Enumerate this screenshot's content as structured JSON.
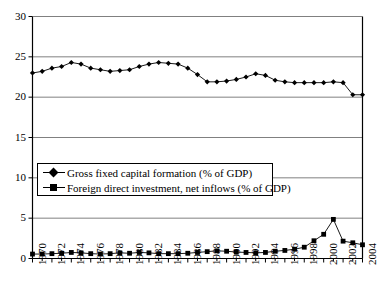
{
  "chart_data": {
    "type": "line",
    "title": "",
    "xlabel": "",
    "ylabel": "",
    "xlim": [
      1970,
      2004
    ],
    "ylim": [
      0,
      30
    ],
    "yticks": [
      0,
      5,
      10,
      15,
      20,
      25,
      30
    ],
    "ytick_labels": [
      "0",
      "5",
      "10",
      "15",
      "20",
      "25",
      "30"
    ],
    "grid": "horizontal",
    "legend_position": "center-left",
    "x": [
      1970,
      1971,
      1972,
      1973,
      1974,
      1975,
      1976,
      1977,
      1978,
      1979,
      1980,
      1981,
      1982,
      1983,
      1984,
      1985,
      1986,
      1987,
      1988,
      1989,
      1990,
      1991,
      1992,
      1993,
      1994,
      1995,
      1996,
      1997,
      1998,
      1999,
      2000,
      2001,
      2002,
      2003,
      2004
    ],
    "xtick_labels": [
      "1970",
      "1972",
      "1974",
      "1976",
      "1978",
      "1980",
      "1982",
      "1984",
      "1986",
      "1988",
      "1990",
      "1992",
      "1994",
      "1996",
      "1998",
      "2000",
      "2002",
      "2004"
    ],
    "xtick_values": [
      1970,
      1972,
      1974,
      1976,
      1978,
      1980,
      1982,
      1984,
      1986,
      1988,
      1990,
      1992,
      1994,
      1996,
      1998,
      2000,
      2002,
      2004
    ],
    "series": [
      {
        "name": "Gross fixed capital formation (% of GDP)",
        "marker": "diamond",
        "color": "#000000",
        "values": [
          23.0,
          23.2,
          23.6,
          23.8,
          24.3,
          24.1,
          23.6,
          23.4,
          23.2,
          23.3,
          23.4,
          23.8,
          24.1,
          24.3,
          24.2,
          24.1,
          23.6,
          22.8,
          21.9,
          21.9,
          22.0,
          22.2,
          22.5,
          22.9,
          22.7,
          22.1,
          21.9,
          21.8,
          21.8,
          21.8,
          21.8,
          21.9,
          21.8,
          20.3,
          20.3
        ]
      },
      {
        "name": "Foreign direct investment, net inflows (% of GDP)",
        "marker": "square",
        "color": "#000000",
        "values": [
          0.55,
          0.55,
          0.6,
          0.65,
          0.75,
          0.7,
          0.6,
          0.55,
          0.6,
          0.7,
          0.65,
          0.75,
          0.7,
          0.6,
          0.6,
          0.6,
          0.65,
          0.75,
          0.85,
          0.95,
          0.9,
          0.8,
          0.75,
          0.7,
          0.75,
          0.9,
          1.0,
          1.15,
          1.4,
          2.2,
          3.0,
          4.85,
          2.15,
          1.95,
          1.7
        ]
      }
    ]
  },
  "axes": {
    "y_tick_labels": [
      "30",
      "25",
      "20",
      "15",
      "10",
      "5",
      "0"
    ]
  },
  "legend": {
    "items": [
      {
        "label": "Gross fixed capital formation (% of GDP)",
        "marker": "diamond"
      },
      {
        "label": "Foreign direct investment, net inflows (% of GDP)",
        "marker": "square"
      }
    ]
  }
}
